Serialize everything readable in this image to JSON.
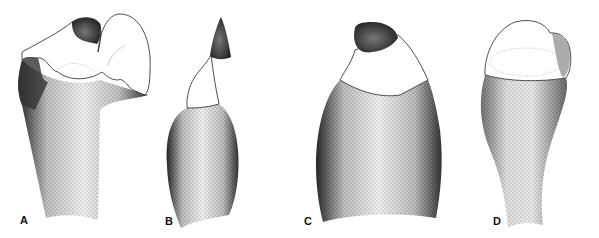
{
  "figure": {
    "panels": [
      {
        "label": "A",
        "subject": "specimen-A-stippled-drawing"
      },
      {
        "label": "B",
        "subject": "specimen-B-stippled-drawing"
      },
      {
        "label": "C",
        "subject": "specimen-C-stippled-drawing"
      },
      {
        "label": "D",
        "subject": "specimen-D-stippled-drawing"
      }
    ],
    "colors": {
      "ink": "#111111",
      "background": "#ffffff"
    }
  }
}
